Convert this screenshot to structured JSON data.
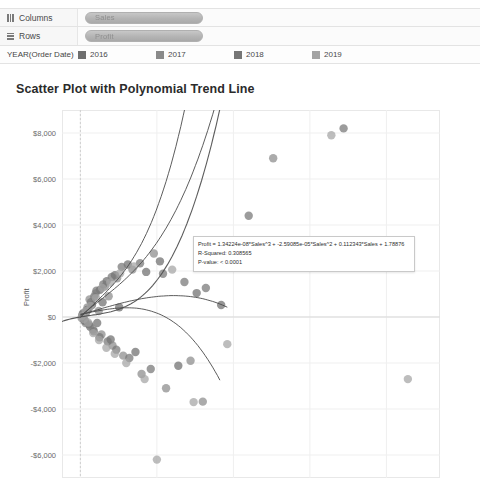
{
  "shelves": {
    "columns": {
      "label": "Columns",
      "pill": "Sales",
      "icon": "columns-grip-icon"
    },
    "rows": {
      "label": "Rows",
      "pill": "Profit",
      "icon": "rows-grip-icon"
    }
  },
  "legend": {
    "title": "YEAR(Order Date)",
    "items": [
      {
        "label": "2016",
        "color": "#6e6e6e"
      },
      {
        "label": "2017",
        "color": "#8a8a8a"
      },
      {
        "label": "2018",
        "color": "#767676"
      },
      {
        "label": "2019",
        "color": "#a3a3a3"
      }
    ]
  },
  "tooltip": {
    "equation": "Profit = 1.34224e-08*Sales^3 + -2.59085e-05*Sales^2 + 0.112343*Sales + 1.78876",
    "r_squared": "R-Squared: 0.308565",
    "p_value": "P-value: < 0.0001"
  },
  "chart_data": {
    "type": "scatter",
    "title": "Scatter Plot with Polynomial Trend Line",
    "xlabel": "Sales",
    "ylabel": "Profit",
    "xlim": [
      -1200,
      23500
    ],
    "ylim": [
      -7000,
      9000
    ],
    "xticks": [
      0,
      5000,
      10000,
      15000,
      20000
    ],
    "xticklabels": [
      "$0",
      "$5,000",
      "$10,000",
      "$15,000",
      "$20,000"
    ],
    "yticks": [
      8000,
      6000,
      4000,
      2000,
      0,
      -2000,
      -4000,
      -6000
    ],
    "yticklabels": [
      "$8,000",
      "$6,000",
      "$4,000",
      "$2,000",
      "$0",
      "-$2,000",
      "-$4,000",
      "-$6,000"
    ],
    "grid": true,
    "legend_position": "top",
    "trend_model": "polynomial degree 3",
    "trend_equation_coeffs": [
      1.34224e-08,
      -2.59085e-05,
      0.112343,
      1.78876
    ],
    "r_squared": 0.308565,
    "p_value": "< 0.0001",
    "series": [
      {
        "name": "2016",
        "color": "#6e6e6e",
        "points": [
          [
            120,
            60
          ],
          [
            260,
            -130
          ],
          [
            380,
            210
          ],
          [
            520,
            340
          ],
          [
            640,
            -420
          ],
          [
            760,
            520
          ],
          [
            900,
            880
          ],
          [
            1100,
            -260
          ],
          [
            1280,
            1180
          ],
          [
            1450,
            640
          ],
          [
            1720,
            1560
          ],
          [
            1980,
            -980
          ],
          [
            2260,
            1820
          ],
          [
            2540,
            420
          ],
          [
            3100,
            2280
          ],
          [
            3600,
            -1520
          ],
          [
            4300,
            1960
          ],
          [
            5200,
            2420
          ],
          [
            6400,
            -2120
          ],
          [
            7600,
            1040
          ],
          [
            9200,
            520
          ]
        ]
      },
      {
        "name": "2017",
        "color": "#8a8a8a",
        "points": [
          [
            80,
            -40
          ],
          [
            200,
            180
          ],
          [
            340,
            -260
          ],
          [
            470,
            420
          ],
          [
            600,
            760
          ],
          [
            820,
            -540
          ],
          [
            1000,
            1020
          ],
          [
            1200,
            260
          ],
          [
            1380,
            -760
          ],
          [
            1600,
            1320
          ],
          [
            1850,
            900
          ],
          [
            2100,
            -1240
          ],
          [
            2400,
            1680
          ],
          [
            2800,
            -1680
          ],
          [
            3400,
            2060
          ],
          [
            4000,
            -2480
          ],
          [
            4800,
            2760
          ],
          [
            5600,
            -3100
          ],
          [
            7200,
            -1900
          ],
          [
            8000,
            -3680
          ],
          [
            12600,
            6900
          ]
        ]
      },
      {
        "name": "2018",
        "color": "#767676",
        "points": [
          [
            150,
            120
          ],
          [
            290,
            -180
          ],
          [
            430,
            300
          ],
          [
            560,
            -320
          ],
          [
            700,
            640
          ],
          [
            880,
            -620
          ],
          [
            1050,
            1140
          ],
          [
            1250,
            -880
          ],
          [
            1500,
            1420
          ],
          [
            1780,
            -1060
          ],
          [
            2050,
            1740
          ],
          [
            2350,
            -1420
          ],
          [
            2700,
            2180
          ],
          [
            3200,
            -1780
          ],
          [
            3900,
            2340
          ],
          [
            4600,
            -2260
          ],
          [
            5400,
            1880
          ],
          [
            6800,
            1520
          ],
          [
            8200,
            1260
          ],
          [
            11000,
            4400
          ],
          [
            17200,
            8200
          ]
        ]
      },
      {
        "name": "2019",
        "color": "#a3a3a3",
        "points": [
          [
            110,
            40
          ],
          [
            240,
            -90
          ],
          [
            360,
            250
          ],
          [
            500,
            -240
          ],
          [
            660,
            480
          ],
          [
            840,
            -700
          ],
          [
            1020,
            820
          ],
          [
            1220,
            -1000
          ],
          [
            1420,
            1260
          ],
          [
            1700,
            -1340
          ],
          [
            1950,
            1500
          ],
          [
            2250,
            -1600
          ],
          [
            2600,
            1900
          ],
          [
            3000,
            -2000
          ],
          [
            3500,
            2200
          ],
          [
            4200,
            -2700
          ],
          [
            5000,
            -6200
          ],
          [
            6000,
            2060
          ],
          [
            7400,
            -3700
          ],
          [
            9600,
            -1180
          ],
          [
            16400,
            7900
          ],
          [
            21400,
            -2700
          ]
        ]
      }
    ]
  }
}
